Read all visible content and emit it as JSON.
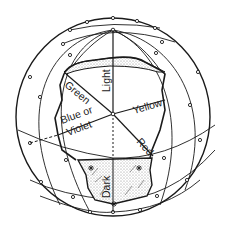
{
  "diagram": {
    "type": "color-sphere",
    "labels": {
      "top": "Light",
      "bottom": "Dark",
      "upper_left": "Green",
      "right": "Yellow",
      "left_line1": "Blue or",
      "left_line2": "Violet",
      "lower_right": "Red"
    },
    "colors": {
      "line": "#1a1a1a",
      "background": "#ffffff",
      "stipple": "#9a9a9a"
    }
  }
}
